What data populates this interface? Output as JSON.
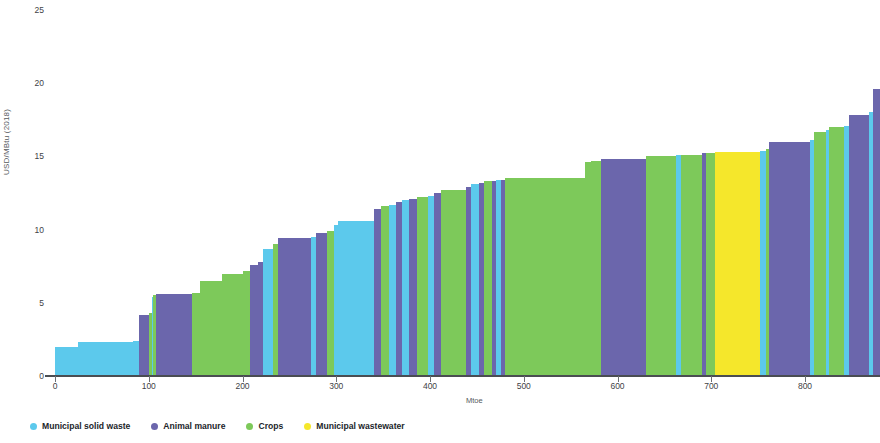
{
  "chart_data": {
    "type": "bar",
    "title": "",
    "xlabel": "Mtoe",
    "ylabel": "USD/MBtu (2018)",
    "xlim": [
      0,
      880
    ],
    "ylim": [
      0,
      25
    ],
    "grid": false,
    "legend_position": "bottom-left",
    "xticks": [
      0,
      100,
      200,
      300,
      400,
      500,
      600,
      700,
      800
    ],
    "yticks": [
      0,
      5,
      10,
      15,
      20,
      25
    ],
    "series": [
      {
        "name": "Municipal solid waste",
        "color": "#5CC9EC"
      },
      {
        "name": "Animal manure",
        "color": "#6B66AC"
      },
      {
        "name": "Crops",
        "color": "#7DC95A"
      },
      {
        "name": "Municipal wastewater",
        "color": "#F5E72B"
      }
    ],
    "note": "Supply cost curve: each bar spans a quantity range (Mtoe) at a given cost (USD/MBtu), colored by feedstock.",
    "bars": [
      {
        "x0": 0,
        "x1": 25,
        "y": 2.0,
        "feedstock": "Municipal solid waste"
      },
      {
        "x0": 25,
        "x1": 83,
        "y": 2.3,
        "feedstock": "Municipal solid waste"
      },
      {
        "x0": 83,
        "x1": 90,
        "y": 2.4,
        "feedstock": "Municipal solid waste"
      },
      {
        "x0": 90,
        "x1": 100,
        "y": 4.2,
        "feedstock": "Animal manure"
      },
      {
        "x0": 100,
        "x1": 103,
        "y": 4.3,
        "feedstock": "Crops"
      },
      {
        "x0": 103,
        "x1": 105,
        "y": 5.4,
        "feedstock": "Municipal solid waste"
      },
      {
        "x0": 105,
        "x1": 108,
        "y": 5.5,
        "feedstock": "Crops"
      },
      {
        "x0": 108,
        "x1": 146,
        "y": 5.6,
        "feedstock": "Animal manure"
      },
      {
        "x0": 146,
        "x1": 155,
        "y": 5.7,
        "feedstock": "Crops"
      },
      {
        "x0": 155,
        "x1": 178,
        "y": 6.5,
        "feedstock": "Crops"
      },
      {
        "x0": 178,
        "x1": 200,
        "y": 7.0,
        "feedstock": "Crops"
      },
      {
        "x0": 200,
        "x1": 208,
        "y": 7.2,
        "feedstock": "Crops"
      },
      {
        "x0": 208,
        "x1": 216,
        "y": 7.6,
        "feedstock": "Animal manure"
      },
      {
        "x0": 216,
        "x1": 222,
        "y": 7.8,
        "feedstock": "Animal manure"
      },
      {
        "x0": 222,
        "x1": 232,
        "y": 8.7,
        "feedstock": "Municipal solid waste"
      },
      {
        "x0": 232,
        "x1": 238,
        "y": 9.0,
        "feedstock": "Crops"
      },
      {
        "x0": 238,
        "x1": 273,
        "y": 9.4,
        "feedstock": "Animal manure"
      },
      {
        "x0": 273,
        "x1": 278,
        "y": 9.5,
        "feedstock": "Municipal solid waste"
      },
      {
        "x0": 278,
        "x1": 290,
        "y": 9.8,
        "feedstock": "Animal manure"
      },
      {
        "x0": 290,
        "x1": 298,
        "y": 9.9,
        "feedstock": "Crops"
      },
      {
        "x0": 298,
        "x1": 302,
        "y": 10.3,
        "feedstock": "Municipal solid waste"
      },
      {
        "x0": 302,
        "x1": 340,
        "y": 10.6,
        "feedstock": "Municipal solid waste"
      },
      {
        "x0": 340,
        "x1": 348,
        "y": 11.4,
        "feedstock": "Animal manure"
      },
      {
        "x0": 348,
        "x1": 356,
        "y": 11.6,
        "feedstock": "Crops"
      },
      {
        "x0": 356,
        "x1": 364,
        "y": 11.7,
        "feedstock": "Municipal solid waste"
      },
      {
        "x0": 364,
        "x1": 370,
        "y": 11.9,
        "feedstock": "Animal manure"
      },
      {
        "x0": 370,
        "x1": 378,
        "y": 12.0,
        "feedstock": "Municipal solid waste"
      },
      {
        "x0": 378,
        "x1": 386,
        "y": 12.1,
        "feedstock": "Animal manure"
      },
      {
        "x0": 386,
        "x1": 398,
        "y": 12.2,
        "feedstock": "Crops"
      },
      {
        "x0": 398,
        "x1": 404,
        "y": 12.3,
        "feedstock": "Municipal solid waste"
      },
      {
        "x0": 404,
        "x1": 412,
        "y": 12.5,
        "feedstock": "Animal manure"
      },
      {
        "x0": 412,
        "x1": 438,
        "y": 12.7,
        "feedstock": "Crops"
      },
      {
        "x0": 438,
        "x1": 444,
        "y": 12.9,
        "feedstock": "Animal manure"
      },
      {
        "x0": 444,
        "x1": 452,
        "y": 13.1,
        "feedstock": "Municipal solid waste"
      },
      {
        "x0": 452,
        "x1": 458,
        "y": 13.2,
        "feedstock": "Animal manure"
      },
      {
        "x0": 458,
        "x1": 466,
        "y": 13.3,
        "feedstock": "Crops"
      },
      {
        "x0": 466,
        "x1": 470,
        "y": 13.3,
        "feedstock": "Animal manure"
      },
      {
        "x0": 470,
        "x1": 476,
        "y": 13.4,
        "feedstock": "Municipal solid waste"
      },
      {
        "x0": 476,
        "x1": 480,
        "y": 13.4,
        "feedstock": "Animal manure"
      },
      {
        "x0": 480,
        "x1": 565,
        "y": 13.5,
        "feedstock": "Crops"
      },
      {
        "x0": 565,
        "x1": 572,
        "y": 14.6,
        "feedstock": "Crops"
      },
      {
        "x0": 572,
        "x1": 582,
        "y": 14.7,
        "feedstock": "Crops"
      },
      {
        "x0": 582,
        "x1": 630,
        "y": 14.8,
        "feedstock": "Animal manure"
      },
      {
        "x0": 630,
        "x1": 662,
        "y": 15.0,
        "feedstock": "Crops"
      },
      {
        "x0": 662,
        "x1": 668,
        "y": 15.1,
        "feedstock": "Municipal solid waste"
      },
      {
        "x0": 668,
        "x1": 690,
        "y": 15.1,
        "feedstock": "Crops"
      },
      {
        "x0": 690,
        "x1": 694,
        "y": 15.2,
        "feedstock": "Animal manure"
      },
      {
        "x0": 694,
        "x1": 704,
        "y": 15.2,
        "feedstock": "Crops"
      },
      {
        "x0": 704,
        "x1": 752,
        "y": 15.3,
        "feedstock": "Municipal wastewater"
      },
      {
        "x0": 752,
        "x1": 758,
        "y": 15.4,
        "feedstock": "Municipal solid waste"
      },
      {
        "x0": 758,
        "x1": 762,
        "y": 15.5,
        "feedstock": "Crops"
      },
      {
        "x0": 762,
        "x1": 805,
        "y": 16.0,
        "feedstock": "Animal manure"
      },
      {
        "x0": 805,
        "x1": 810,
        "y": 16.1,
        "feedstock": "Municipal solid waste"
      },
      {
        "x0": 810,
        "x1": 822,
        "y": 16.7,
        "feedstock": "Crops"
      },
      {
        "x0": 822,
        "x1": 826,
        "y": 16.8,
        "feedstock": "Municipal solid waste"
      },
      {
        "x0": 826,
        "x1": 842,
        "y": 17.0,
        "feedstock": "Crops"
      },
      {
        "x0": 842,
        "x1": 847,
        "y": 17.1,
        "feedstock": "Municipal solid waste"
      },
      {
        "x0": 847,
        "x1": 868,
        "y": 17.8,
        "feedstock": "Animal manure"
      },
      {
        "x0": 868,
        "x1": 872,
        "y": 18.0,
        "feedstock": "Municipal solid waste"
      },
      {
        "x0": 872,
        "x1": 880,
        "y": 19.6,
        "feedstock": "Animal manure"
      }
    ]
  },
  "axis": {
    "y_label": "USD/MBtu (2018)",
    "x_label": "Mtoe",
    "y_ticks": [
      "0",
      "5",
      "10",
      "15",
      "20",
      "25"
    ],
    "x_ticks": [
      "0",
      "100",
      "200",
      "300",
      "400",
      "500",
      "600",
      "700",
      "800"
    ]
  },
  "legend": {
    "items": [
      {
        "label": "Municipal solid waste",
        "color": "#5CC9EC"
      },
      {
        "label": "Animal manure",
        "color": "#6B66AC"
      },
      {
        "label": "Crops",
        "color": "#7DC95A"
      },
      {
        "label": "Municipal wastewater",
        "color": "#F5E72B"
      }
    ]
  },
  "watermark": {
    "left_text": "fotophire",
    "right_text": "fotophire"
  }
}
